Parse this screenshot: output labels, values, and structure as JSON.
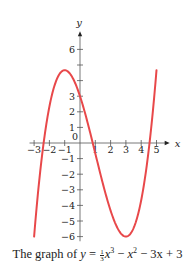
{
  "chart_data": {
    "type": "line",
    "function": "y = (1/3)x^3 - x^2 - 3x + 3",
    "xlabel": "x",
    "ylabel": "y",
    "xlim": [
      -3.3,
      5.6
    ],
    "ylim": [
      -6.3,
      6.9
    ],
    "x_domain": [
      -3,
      5
    ],
    "x_ticks": [
      -3,
      -2,
      -1,
      0,
      1,
      2,
      3,
      4,
      5
    ],
    "x_tick_labels": [
      "−3",
      "−2",
      "−1",
      "0",
      "1",
      "2",
      "3",
      "4",
      "5"
    ],
    "y_ticks": [
      -6,
      -5,
      -4,
      -3,
      -2,
      -1,
      1,
      2,
      3,
      4,
      5,
      6
    ],
    "y_tick_labels": [
      "−6",
      "−5",
      "−4",
      "−3",
      "−2",
      "−1",
      "1",
      "2",
      "3",
      "",
      "",
      "6"
    ],
    "key_points": [
      {
        "label": "local max",
        "x": -1,
        "y": 4.67
      },
      {
        "label": "y-intercept",
        "x": 0,
        "y": 3
      },
      {
        "label": "local min",
        "x": 3,
        "y": -6
      },
      {
        "label": "left end",
        "x": -3,
        "y": -6
      },
      {
        "label": "right end",
        "x": 5,
        "y": 4.67
      }
    ],
    "series": [
      {
        "name": "y = 1/3 x^3 - x^2 - 3x + 3",
        "color": "#e8484a"
      }
    ],
    "grid": false,
    "legend": "none"
  },
  "caption": {
    "prefix": "The graph of ",
    "y": "y",
    "eq": " = ",
    "frac_num": "1",
    "frac_den": "3",
    "x1": "x",
    "exp1": "3",
    "minus1": " − ",
    "x2": "x",
    "exp2": "2",
    "rest": " − 3x + 3"
  },
  "colors": {
    "curve": "#e8484a",
    "axis": "#555555",
    "text": "#222222"
  }
}
